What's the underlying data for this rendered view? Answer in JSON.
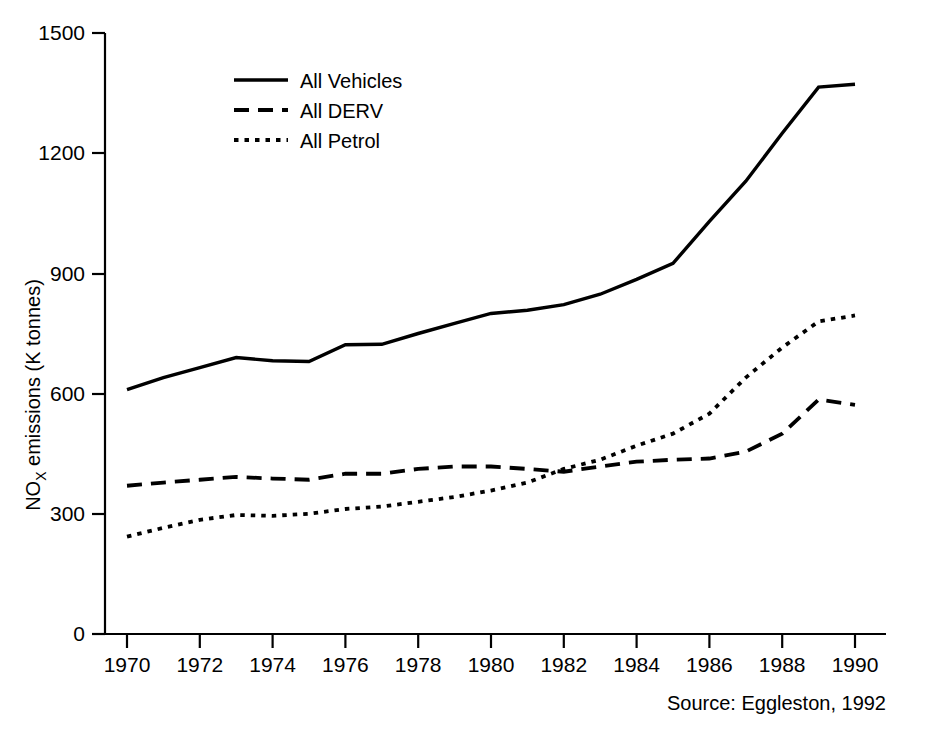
{
  "figure": {
    "clipped_title": "Road Transport NOx Emissions by Vehicle Type (UK 1970-90)",
    "source": "Source: Eggleston, 1992"
  },
  "legend": {
    "position": "top-left-inside",
    "entries": [
      {
        "label": "All Vehicles",
        "style": "solid"
      },
      {
        "label": "All DERV",
        "style": "dashed"
      },
      {
        "label": "All Petrol",
        "style": "dotted"
      }
    ]
  },
  "axes": {
    "y_title_main": "emissions (K tonnes)",
    "y_title_prefix": "NO",
    "y_title_sub": "X",
    "y_ticks": [
      "0",
      "300",
      "600",
      "900",
      "1200",
      "1500"
    ],
    "x_ticks": [
      "1970",
      "1972",
      "1974",
      "1976",
      "1978",
      "1980",
      "1982",
      "1984",
      "1986",
      "1988",
      "1990"
    ]
  },
  "chart_data": {
    "type": "line",
    "title": "Road Transport NOx Emissions by Vehicle Type (UK 1970-90)",
    "xlabel": "",
    "ylabel": "NOx emissions (K tonnes)",
    "xlim": [
      1970,
      1990
    ],
    "ylim": [
      0,
      1500
    ],
    "grid": false,
    "legend_position": "upper left",
    "x": [
      1970,
      1971,
      1972,
      1973,
      1974,
      1975,
      1976,
      1977,
      1978,
      1979,
      1980,
      1981,
      1982,
      1983,
      1984,
      1985,
      1986,
      1987,
      1988,
      1989,
      1990
    ],
    "series": [
      {
        "name": "All Vehicles",
        "style": "solid",
        "values": [
          610,
          640,
          665,
          690,
          682,
          680,
          722,
          723,
          750,
          775,
          800,
          808,
          822,
          848,
          885,
          925,
          1030,
          1130,
          1250,
          1365,
          1372
        ]
      },
      {
        "name": "All DERV",
        "style": "dashed",
        "values": [
          370,
          378,
          385,
          392,
          388,
          385,
          400,
          400,
          412,
          418,
          418,
          412,
          405,
          418,
          430,
          435,
          438,
          455,
          500,
          585,
          572
        ]
      },
      {
        "name": "All Petrol",
        "style": "dotted",
        "values": [
          243,
          265,
          285,
          297,
          295,
          300,
          312,
          318,
          330,
          342,
          358,
          378,
          412,
          435,
          470,
          500,
          550,
          640,
          715,
          780,
          795
        ]
      }
    ],
    "source": "Source: Eggleston, 1992"
  }
}
